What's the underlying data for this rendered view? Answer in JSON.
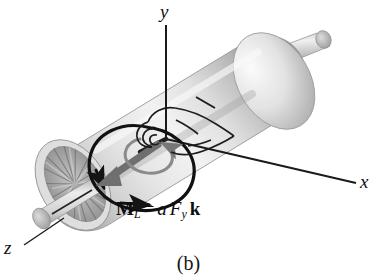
{
  "figure": {
    "caption": "(b)",
    "kind": "engineering-free-body-diagram",
    "background_color": "#ffffff"
  },
  "axes": {
    "y": {
      "label": "y",
      "from": [
        166,
        140
      ],
      "to": [
        166,
        25
      ],
      "color": "#1a1a1a"
    },
    "x": {
      "label": "x",
      "from": [
        166,
        139
      ],
      "to": [
        356,
        183
      ],
      "color": "#1a1a1a"
    },
    "z": {
      "label": "z",
      "from": [
        64,
        218
      ],
      "to": [
        22,
        247
      ],
      "color": "#1a1a1a"
    },
    "origin": [
      166,
      139
    ]
  },
  "equation": {
    "moment_symbol": "M",
    "moment_subscript": "L",
    "equals": "=",
    "coefficient": "a",
    "force_symbol": "F",
    "force_subscript": "y",
    "unit_vector": "k",
    "plain_text": "M_L = a F_y k"
  },
  "annotations": {
    "hand_label": "right-hand-rule hand outline",
    "moment_arrow_label": "moment vector arrow (toward -z)",
    "circulation_label": "circulation sense arrow",
    "fan_label": "radial fan blade face",
    "shaft_left_label": "left shaft stub",
    "shaft_right_label": "right shaft stub"
  },
  "colors": {
    "body_light": "#ededed",
    "body_mid": "#d2d2d2",
    "body_shadow": "#9e9e9e",
    "fan_gray": "#a9a9a9",
    "fan_dark": "#7d7d7d",
    "line_black": "#1a1a1a",
    "arrow_gray": "#6f6f6f",
    "text": "#111111"
  }
}
